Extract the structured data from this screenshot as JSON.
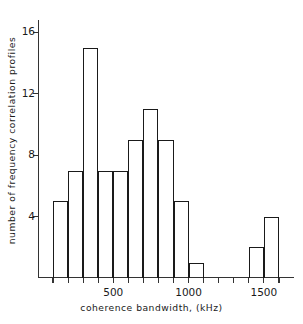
{
  "chart_data": {
    "type": "bar",
    "title": "",
    "subtitle": "",
    "xlabel": "coherence bandwidth, (kHz)",
    "ylabel": "number of frequency correlation profiles",
    "xlim": [
      0,
      1700
    ],
    "ylim": [
      0,
      16.8
    ],
    "grid": false,
    "legend": null,
    "bin_width": 100,
    "x_tick_labels": [
      "500",
      "1000",
      "1500"
    ],
    "x_tick_values": [
      500,
      1000,
      1500
    ],
    "x_minor_tick_values": [
      100,
      200,
      300,
      400,
      600,
      700,
      800,
      900,
      1100,
      1200,
      1300,
      1400,
      1600
    ],
    "y_tick_labels": [
      "4",
      "8",
      "12",
      "16"
    ],
    "y_tick_values": [
      4,
      8,
      12,
      16
    ],
    "bin_edges": [
      100,
      200,
      300,
      400,
      500,
      600,
      700,
      800,
      900,
      1000,
      1100,
      1400,
      1500,
      1600
    ],
    "bars": [
      {
        "x0": 100,
        "x1": 200,
        "value": 5
      },
      {
        "x0": 200,
        "x1": 300,
        "value": 7
      },
      {
        "x0": 300,
        "x1": 400,
        "value": 15
      },
      {
        "x0": 400,
        "x1": 500,
        "value": 7
      },
      {
        "x0": 500,
        "x1": 600,
        "value": 7
      },
      {
        "x0": 600,
        "x1": 700,
        "value": 9
      },
      {
        "x0": 700,
        "x1": 800,
        "value": 11
      },
      {
        "x0": 800,
        "x1": 900,
        "value": 9
      },
      {
        "x0": 900,
        "x1": 1000,
        "value": 5
      },
      {
        "x0": 1000,
        "x1": 1100,
        "value": 1
      },
      {
        "x0": 1400,
        "x1": 1500,
        "value": 2
      },
      {
        "x0": 1500,
        "x1": 1600,
        "value": 4
      }
    ],
    "categories": [
      "100-200",
      "200-300",
      "300-400",
      "400-500",
      "500-600",
      "600-700",
      "700-800",
      "800-900",
      "900-1000",
      "1000-1100",
      "1400-1500",
      "1500-1600"
    ],
    "values": [
      5,
      7,
      15,
      7,
      7,
      9,
      11,
      9,
      5,
      1,
      2,
      4
    ],
    "colors": {
      "bar_edge": "#1a1a1a",
      "bar_fill": "transparent",
      "axis": "#333333",
      "text": "#1a1a1a",
      "background": "#ffffff"
    }
  }
}
